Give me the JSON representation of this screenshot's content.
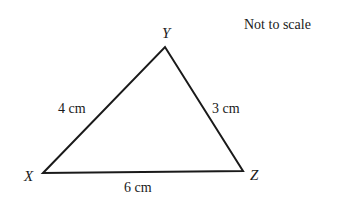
{
  "diagram": {
    "note": "Not to scale",
    "vertices": {
      "X": {
        "label": "X",
        "x": 43,
        "y": 173
      },
      "Y": {
        "label": "Y",
        "x": 165,
        "y": 47
      },
      "Z": {
        "label": "Z",
        "x": 243,
        "y": 171
      }
    },
    "sides": {
      "XY": "4 cm",
      "YZ": "3 cm",
      "XZ": "6 cm"
    },
    "line_color": "#1a1a1a"
  }
}
